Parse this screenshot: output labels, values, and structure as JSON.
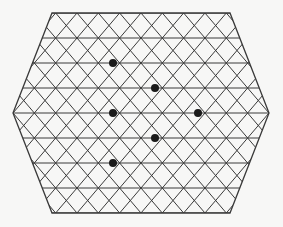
{
  "figure": {
    "name": "hexagonal-triangular-lattice",
    "canvas": {
      "width": 283,
      "height": 227
    },
    "background_color": "#f7f7f6",
    "line_color": "#3a3a3a",
    "line_width": 1.0,
    "border_width": 1.3,
    "marker_color": "#1a1a1a",
    "marker_radius": 4.0
  },
  "lattice": {
    "description": "Flat-top regular hexagon subdivided into equilateral triangles",
    "rows": 8,
    "columns": 12,
    "cell_width": 21.33,
    "cell_height": 25.0,
    "origin_x": 13,
    "origin_y": 13,
    "center_x": 141,
    "center_y": 113,
    "hexagon_vertices": [
      {
        "x": 52,
        "y": 13
      },
      {
        "x": 230,
        "y": 13
      },
      {
        "x": 269,
        "y": 113
      },
      {
        "x": 230,
        "y": 213
      },
      {
        "x": 52,
        "y": 213
      },
      {
        "x": 13,
        "y": 113
      }
    ],
    "horizontal_line_rows": [
      0,
      1,
      2,
      3,
      4,
      5,
      6,
      7,
      8
    ],
    "marked_points": [
      {
        "id": "dot-1",
        "col": 4.7,
        "row": 2,
        "x": 113,
        "y": 63
      },
      {
        "id": "dot-2",
        "col": 6.7,
        "row": 3,
        "x": 155,
        "y": 88
      },
      {
        "id": "dot-3",
        "col": 4.7,
        "row": 4,
        "x": 113,
        "y": 113
      },
      {
        "id": "dot-4",
        "col": 8.7,
        "row": 4,
        "x": 198,
        "y": 113
      },
      {
        "id": "dot-5",
        "col": 6.7,
        "row": 5,
        "x": 155,
        "y": 138
      },
      {
        "id": "dot-6",
        "col": 4.7,
        "row": 6,
        "x": 113,
        "y": 163
      }
    ]
  }
}
